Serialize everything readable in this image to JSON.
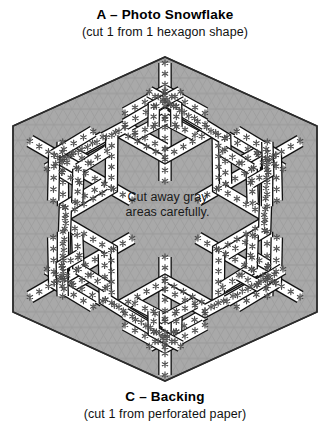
{
  "document": {
    "kind": "craft-cutting-template",
    "background_color": "#ffffff"
  },
  "top_label": {
    "title": "A – Photo Snowflake",
    "subtitle": "(cut 1 from 1 hexagon shape)"
  },
  "bottom_label": {
    "title": "C – Backing",
    "subtitle": "(cut 1 from perforated paper)"
  },
  "center_note": {
    "line1": "Cut away gray",
    "line2": "areas carefully."
  },
  "colors": {
    "gray_fill": "#a9a9a9",
    "grid_line": "#8e8e8e",
    "grid_line_light": "#bdbdbd",
    "outline": "#000000",
    "white_channel": "#ffffff",
    "text": "#000000"
  },
  "figure": {
    "shape_name": "hexagon",
    "hexagon": {
      "center_x": 165,
      "center_y": 219,
      "vertices": [
        [
          165,
          57
        ],
        [
          317,
          126
        ],
        [
          317,
          312
        ],
        [
          165,
          381
        ],
        [
          13,
          312
        ],
        [
          13,
          126
        ]
      ]
    },
    "motif_name": "snowflake",
    "symmetry_fold": 6,
    "star_glyph": "✳",
    "star_count_per_sector": 26,
    "grid_spacing_px": 9
  }
}
